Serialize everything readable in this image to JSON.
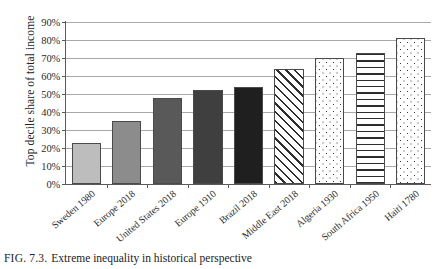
{
  "figure": {
    "caption_number": "FIG. 7.3.",
    "caption_text": "Extreme inequality in historical perspective",
    "y_axis_title": "Top decile share of total income"
  },
  "chart_data": {
    "type": "bar",
    "title": "Extreme inequality in historical perspective",
    "xlabel": "",
    "ylabel": "Top decile share of total income",
    "ylim": [
      0,
      90
    ],
    "ytick_labels": [
      "0%",
      "10%",
      "20%",
      "30%",
      "40%",
      "50%",
      "60%",
      "70%",
      "80%",
      "90%"
    ],
    "ytick_values": [
      0,
      10,
      20,
      30,
      40,
      50,
      60,
      70,
      80,
      90
    ],
    "grid": true,
    "legend": "none",
    "categories": [
      "Sweden 1980",
      "Europe 2018",
      "United States 2018",
      "Europe 1910",
      "Brazil 2018",
      "Middle East 2018",
      "Algeria 1930",
      "South Africa 1950",
      "Haiti 1780"
    ],
    "values": [
      23,
      35,
      48,
      52,
      54,
      64,
      70,
      73,
      81
    ],
    "bar_styles": [
      "solid-light-gray",
      "solid-medium-gray",
      "solid-dark-gray",
      "solid-darker-gray",
      "solid-near-black",
      "diagonal-hatch",
      "dotted",
      "horizontal-lines",
      "dotted"
    ],
    "bar_colors": [
      "#bdbdbd",
      "#8c8c8c",
      "#595959",
      "#3f3f3f",
      "#1f1f1f",
      "#ffffff",
      "#ffffff",
      "#ffffff",
      "#ffffff"
    ]
  }
}
